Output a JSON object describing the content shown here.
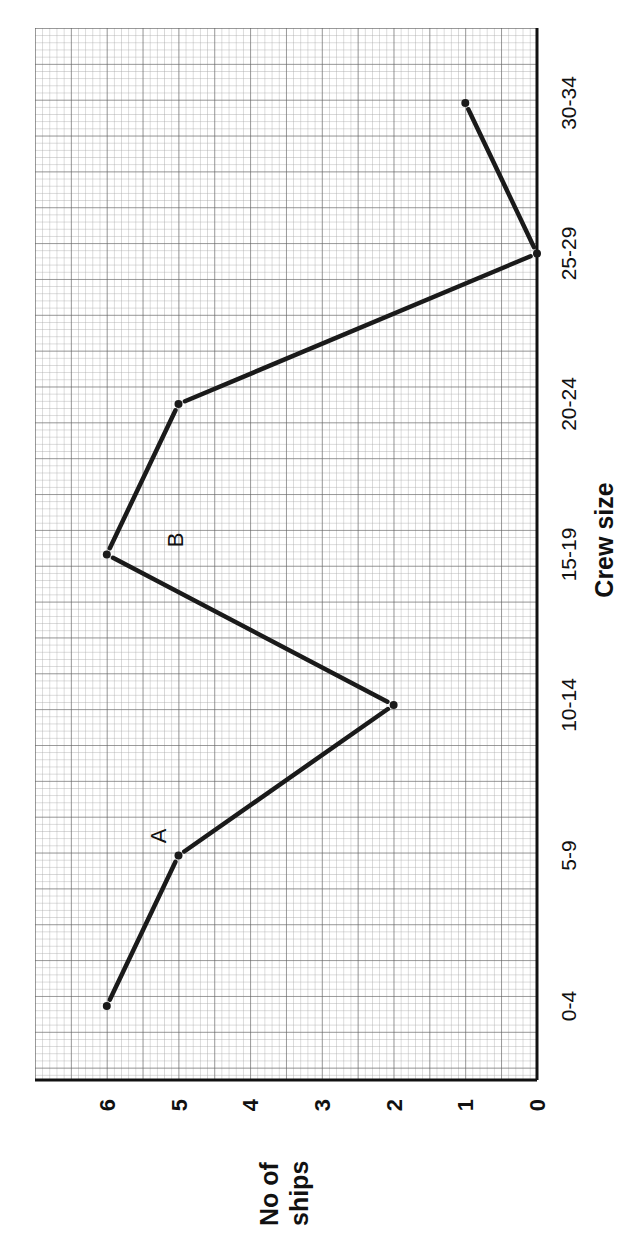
{
  "chart_data": {
    "type": "line",
    "orientation": "rotated -90deg (page turned sideways)",
    "title": "",
    "xlabel": "Crew size",
    "ylabel": "No of ships",
    "ylabel_lines": [
      "No of",
      "ships"
    ],
    "categories": [
      "0-4",
      "5-9",
      "10-14",
      "15-19",
      "20-24",
      "25-29",
      "30-34"
    ],
    "series": [
      {
        "name": "segment-1",
        "points": [
          [
            "0-4",
            6
          ],
          [
            "5-9",
            5
          ]
        ]
      },
      {
        "name": "segment-2",
        "points": [
          [
            "5-9",
            5
          ],
          [
            "10-14",
            2
          ]
        ]
      },
      {
        "name": "segment-3",
        "points": [
          [
            "10-14",
            2
          ],
          [
            "15-19",
            6
          ]
        ]
      },
      {
        "name": "segment-4",
        "points": [
          [
            "15-19",
            6
          ],
          [
            "20-24",
            5
          ]
        ]
      },
      {
        "name": "segment-5",
        "points": [
          [
            "20-24",
            5
          ],
          [
            "25-29",
            0
          ]
        ]
      },
      {
        "name": "segment-6",
        "points": [
          [
            "25-29",
            0
          ],
          [
            "30-34",
            1
          ]
        ]
      }
    ],
    "values": [
      6,
      5,
      2,
      6,
      5,
      0,
      1
    ],
    "yticks": [
      0,
      1,
      2,
      3,
      4,
      5,
      6
    ],
    "ylim": [
      0,
      6.8
    ],
    "grid": true,
    "annotations": [
      {
        "label": "A",
        "near": "5-9"
      },
      {
        "label": "B",
        "near": "between 10-14 and 15-19"
      }
    ],
    "legend": null
  },
  "labels": {
    "annotation_a": "A",
    "annotation_b": "B"
  },
  "colors": {
    "line": "#1a1a1a",
    "grid_minor": "#9a9a9a",
    "grid_major": "#555555",
    "background": "#ffffff"
  }
}
